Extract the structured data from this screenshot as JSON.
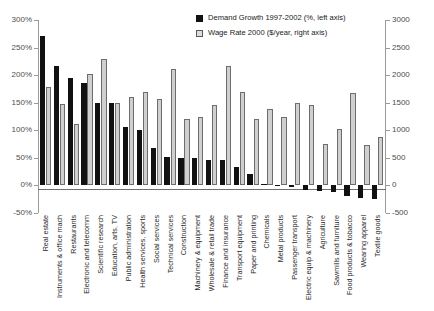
{
  "chart_data": {
    "type": "bar",
    "title": "",
    "xlabel": "",
    "ylabel": "",
    "grid": false,
    "legend_position": "top-right",
    "categories": [
      "Real estate",
      "Instruments & office mach",
      "Restaurants",
      "Electronic and telecomm",
      "Scientific research",
      "Education, arts, TV",
      "Public administration",
      "Health services, sports",
      "Social services",
      "Technical services",
      "Construction",
      "Machinery & equipment",
      "Wholesale & retail trade",
      "Finance and insurance",
      "Transport equipment",
      "Paper and printing",
      "Chemicals",
      "Metal products",
      "Passenger transport",
      "Electric equip & machinery",
      "Agriculture",
      "Sawmills and furniture",
      "Food products & tobacco",
      "Wearing apparel",
      "Textile goods"
    ],
    "series": [
      {
        "name": "Demand Growth 1997-2002 (%, left axis)",
        "axis": "left",
        "unit": "%",
        "color": "#111111",
        "values": [
          271,
          216,
          194,
          185,
          150,
          149,
          106,
          101,
          68,
          51,
          49,
          49,
          47,
          46,
          33,
          21,
          2,
          -1,
          -3,
          -8,
          -10,
          -11,
          -19,
          -22,
          -25
        ]
      },
      {
        "name": "Wage Rate 2000 ($/year, right axis)",
        "axis": "right",
        "unit": "$/year",
        "color": "#cfcfcf",
        "values": [
          1780,
          1470,
          1110,
          2030,
          2290,
          1500,
          1600,
          1700,
          1570,
          2110,
          1200,
          1240,
          1450,
          2160,
          1700,
          1210,
          1390,
          1240,
          1500,
          1450,
          760,
          1020,
          1680,
          740,
          880
        ]
      }
    ],
    "left_axis": {
      "ticks": [
        "300%",
        "250%",
        "200%",
        "150%",
        "100%",
        "50%",
        "0%",
        "-50%"
      ],
      "min": -50,
      "max": 300
    },
    "right_axis": {
      "ticks": [
        "3000",
        "2500",
        "2000",
        "1500",
        "1000",
        "500",
        "0",
        "-500"
      ],
      "min": -500,
      "max": 3000
    }
  }
}
